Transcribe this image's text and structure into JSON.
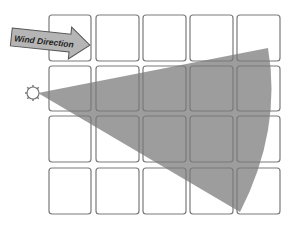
{
  "diagram": {
    "arrow_label": "Wind Direction",
    "source_label": "source",
    "grid": {
      "rows": 4,
      "cols": 5
    },
    "colors": {
      "cell_border": "#7a7a7a",
      "plume_fill": "#8c8c8c",
      "arrow_fill": "#b5b5b5",
      "arrow_stroke": "#555555",
      "source_stroke": "#777777"
    }
  }
}
